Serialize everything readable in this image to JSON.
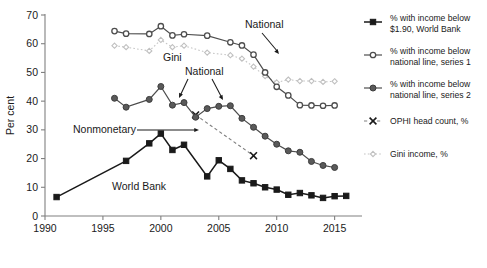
{
  "chart_data": {
    "type": "line",
    "title": "",
    "xlabel": "",
    "ylabel": "Per cent",
    "xlim": [
      1990,
      2016.5
    ],
    "ylim": [
      0,
      70
    ],
    "grid": false,
    "legend_position": "right",
    "xticks": [
      "1990",
      "1995",
      "2000",
      "2005",
      "2010",
      "2015"
    ],
    "xtick_values": [
      1990,
      1995,
      2000,
      2005,
      2010,
      2015
    ],
    "yticks": [
      "0",
      "10",
      "20",
      "30",
      "40",
      "50",
      "60",
      "70"
    ],
    "ytick_values": [
      0,
      10,
      20,
      30,
      40,
      50,
      60,
      70
    ],
    "series": [
      {
        "name": "% with income below $1.90, World Bank",
        "key": "world_bank",
        "marker": "filled-square",
        "color": "#1a1a1a",
        "x": [
          1991,
          1997,
          1999,
          2000,
          2001,
          2002,
          2004,
          2005,
          2006,
          2007,
          2008,
          2009,
          2010,
          2011,
          2012,
          2013,
          2014,
          2015,
          2016
        ],
        "values": [
          6.6,
          19.2,
          25.3,
          28.7,
          23.0,
          24.8,
          13.8,
          19.4,
          16.4,
          12.4,
          11.4,
          10.0,
          9.2,
          7.4,
          8.0,
          7.2,
          6.3,
          6.9,
          7.0
        ]
      },
      {
        "name": "% with income below national line, series 1",
        "key": "national_1",
        "marker": "open-circle",
        "color": "#4d4d4d",
        "x": [
          1996,
          1997,
          1999,
          2000,
          2001,
          2002,
          2004,
          2006,
          2007,
          2008,
          2009,
          2010,
          2011,
          2012,
          2013,
          2014,
          2015
        ],
        "values": [
          64.4,
          63.5,
          63.4,
          66.1,
          62.9,
          63.3,
          62.8,
          60.5,
          59.4,
          56.2,
          50.0,
          45.0,
          42.0,
          38.6,
          38.5,
          38.4,
          38.5
        ]
      },
      {
        "name": "% with income below national line, series 2",
        "key": "national_2",
        "marker": "filled-circle",
        "color": "#5a5a5a",
        "x": [
          1996,
          1997,
          1999,
          2000,
          2001,
          2002,
          2003,
          2004,
          2005,
          2006,
          2007,
          2008,
          2009,
          2010,
          2011,
          2012,
          2013,
          2014,
          2015
        ],
        "values": [
          41.0,
          37.9,
          40.6,
          45.1,
          38.6,
          39.5,
          34.4,
          37.4,
          38.2,
          38.4,
          34.0,
          30.9,
          27.8,
          25.0,
          22.7,
          22.2,
          19.0,
          17.6,
          16.9
        ]
      },
      {
        "name": "OPHI head count, %",
        "key": "ophi",
        "marker": "x-cross",
        "color": "#1a1a1a",
        "x": [
          2003,
          2008
        ],
        "values": [
          35.2,
          21.0
        ]
      },
      {
        "name": "Gini income, %",
        "key": "gini",
        "marker": "open-diamond",
        "color": "#c0c0c0",
        "x": [
          1996,
          1997,
          1999,
          2000,
          2001,
          2002,
          2004,
          2006,
          2007,
          2008,
          2009,
          2010,
          2011,
          2012,
          2013,
          2014,
          2015
        ],
        "values": [
          59.3,
          58.8,
          57.5,
          61.3,
          58.8,
          59.3,
          56.9,
          56.0,
          54.8,
          52.0,
          48.7,
          46.5,
          47.5,
          47.0,
          47.0,
          46.7,
          46.9
        ]
      }
    ],
    "annotations": [
      {
        "label": "National",
        "key": "national_top",
        "x": 245,
        "y": 28
      },
      {
        "label": "Gini",
        "key": "gini_inline",
        "x": 163,
        "y": 61
      },
      {
        "label": "National",
        "key": "national_mid",
        "x": 185,
        "y": 75
      },
      {
        "label": "Nonmonetary",
        "key": "nonmonetary",
        "x": 73,
        "y": 133
      },
      {
        "label": "World Bank",
        "key": "world_bank_inline",
        "x": 112,
        "y": 190
      }
    ]
  },
  "legend": {
    "items": [
      {
        "label_line1": "% with income below",
        "label_line2": "$1.90, World Bank",
        "marker": "filled-square",
        "key": "world_bank"
      },
      {
        "label_line1": "% with income below",
        "label_line2": "national line, series 1",
        "marker": "open-circle",
        "key": "national_1"
      },
      {
        "label_line1": "% with income below",
        "label_line2": "national line, series 2",
        "marker": "filled-circle",
        "key": "national_2"
      },
      {
        "label_line1": "OPHI head count, %",
        "label_line2": "",
        "marker": "x-cross",
        "key": "ophi"
      },
      {
        "label_line1": "Gini income, %",
        "label_line2": "",
        "marker": "open-diamond",
        "key": "gini"
      }
    ]
  },
  "colors": {
    "world_bank": "#1a1a1a",
    "national_1": "#4d4d4d",
    "national_2": "#5a5a5a",
    "ophi": "#1a1a1a",
    "gini": "#c0c0c0",
    "axis": "#808080",
    "background": "#ffffff"
  }
}
